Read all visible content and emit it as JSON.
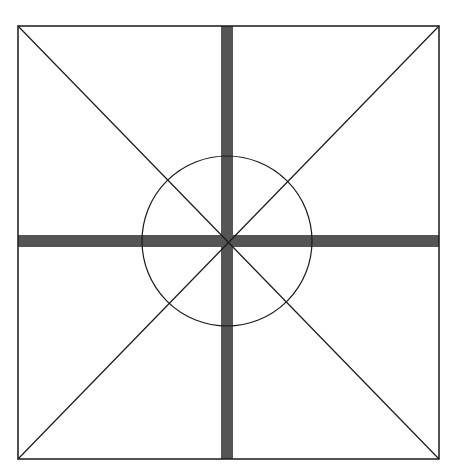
{
  "diagram": {
    "colors": {
      "background": "#ffffff",
      "line": "#1a1a1a",
      "bar": "#555555"
    },
    "square": {
      "x": 18,
      "y": 26,
      "width": 421,
      "height": 433
    },
    "center": {
      "x": 227,
      "y": 241
    },
    "circle_radius": 85,
    "bar_thickness": 12
  }
}
